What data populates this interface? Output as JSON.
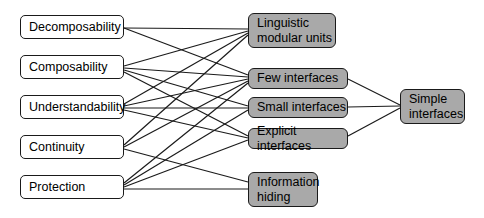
{
  "diagram": {
    "style": {
      "background": "#ffffff",
      "plain_node_fill": "#ffffff",
      "shaded_node_fill": "#a9a9a9",
      "border_color": "#1a1a1a",
      "edge_color": "#1a1a1a"
    },
    "columns": {
      "left_label": "criteria",
      "middle_label": "principles",
      "right_label": "rule"
    },
    "nodes": [
      {
        "id": "decomposability",
        "label": "Decomposability",
        "style": "plain",
        "x": 20,
        "y": 15,
        "w": 104,
        "h": 24
      },
      {
        "id": "composability",
        "label": "Composability",
        "style": "plain",
        "x": 20,
        "y": 55,
        "w": 104,
        "h": 24
      },
      {
        "id": "understandability",
        "label": "Understandability",
        "style": "plain",
        "x": 20,
        "y": 95,
        "w": 104,
        "h": 24
      },
      {
        "id": "continuity",
        "label": "Continuity",
        "style": "plain",
        "x": 20,
        "y": 135,
        "w": 104,
        "h": 24
      },
      {
        "id": "protection",
        "label": "Protection",
        "style": "plain",
        "x": 20,
        "y": 175,
        "w": 104,
        "h": 24
      },
      {
        "id": "linguistic",
        "label": "Linguistic\nmodular units",
        "style": "shaded",
        "x": 248,
        "y": 13,
        "w": 88,
        "h": 35
      },
      {
        "id": "few",
        "label": "Few interfaces",
        "style": "shaded",
        "x": 248,
        "y": 68,
        "w": 100,
        "h": 21
      },
      {
        "id": "small",
        "label": "Small interfaces",
        "style": "shaded",
        "x": 248,
        "y": 97,
        "w": 100,
        "h": 21
      },
      {
        "id": "explicit",
        "label": "Explicit interfaces",
        "style": "shaded",
        "x": 248,
        "y": 128,
        "w": 100,
        "h": 21
      },
      {
        "id": "information",
        "label": "Information\nhiding",
        "style": "shaded",
        "x": 248,
        "y": 172,
        "w": 70,
        "h": 35
      },
      {
        "id": "simple",
        "label": "Simple\ninterfaces",
        "style": "shaded",
        "x": 400,
        "y": 89,
        "w": 65,
        "h": 35
      }
    ],
    "edges": [
      {
        "from": "decomposability",
        "to": "linguistic",
        "x1": 124,
        "y1": 28,
        "x2": 248,
        "y2": 29
      },
      {
        "from": "decomposability",
        "to": "few",
        "x1": 124,
        "y1": 28,
        "x2": 248,
        "y2": 75
      },
      {
        "from": "composability",
        "to": "linguistic",
        "x1": 124,
        "y1": 66,
        "x2": 248,
        "y2": 31
      },
      {
        "from": "composability",
        "to": "few",
        "x1": 124,
        "y1": 68,
        "x2": 248,
        "y2": 77
      },
      {
        "from": "composability",
        "to": "small",
        "x1": 124,
        "y1": 70,
        "x2": 248,
        "y2": 106
      },
      {
        "from": "composability",
        "to": "explicit",
        "x1": 124,
        "y1": 72,
        "x2": 248,
        "y2": 136
      },
      {
        "from": "understandability",
        "to": "linguistic",
        "x1": 124,
        "y1": 104,
        "x2": 248,
        "y2": 33
      },
      {
        "from": "understandability",
        "to": "few",
        "x1": 124,
        "y1": 106,
        "x2": 248,
        "y2": 79
      },
      {
        "from": "understandability",
        "to": "small",
        "x1": 124,
        "y1": 108,
        "x2": 248,
        "y2": 108
      },
      {
        "from": "understandability",
        "to": "explicit",
        "x1": 124,
        "y1": 110,
        "x2": 248,
        "y2": 138
      },
      {
        "from": "continuity",
        "to": "linguistic",
        "x1": 124,
        "y1": 145,
        "x2": 248,
        "y2": 35
      },
      {
        "from": "continuity",
        "to": "few",
        "x1": 124,
        "y1": 147,
        "x2": 248,
        "y2": 81
      },
      {
        "from": "continuity",
        "to": "information",
        "x1": 124,
        "y1": 149,
        "x2": 248,
        "y2": 182
      },
      {
        "from": "protection",
        "to": "few",
        "x1": 124,
        "y1": 183,
        "x2": 248,
        "y2": 83
      },
      {
        "from": "protection",
        "to": "small",
        "x1": 124,
        "y1": 185,
        "x2": 248,
        "y2": 110
      },
      {
        "from": "protection",
        "to": "explicit",
        "x1": 124,
        "y1": 187,
        "x2": 248,
        "y2": 140
      },
      {
        "from": "protection",
        "to": "information",
        "x1": 124,
        "y1": 189,
        "x2": 248,
        "y2": 189
      },
      {
        "from": "few",
        "to": "simple",
        "x1": 348,
        "y1": 79,
        "x2": 400,
        "y2": 105
      },
      {
        "from": "small",
        "to": "simple",
        "x1": 348,
        "y1": 107,
        "x2": 400,
        "y2": 106
      },
      {
        "from": "explicit",
        "to": "simple",
        "x1": 348,
        "y1": 136,
        "x2": 400,
        "y2": 108
      }
    ]
  }
}
